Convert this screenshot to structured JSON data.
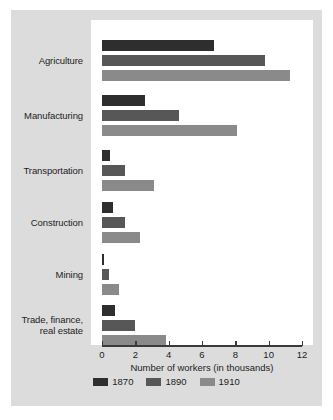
{
  "chart_data": {
    "type": "bar",
    "orientation": "horizontal",
    "title": "",
    "xlabel": "Number of workers (in thousands)",
    "ylabel": "",
    "xlim": [
      0,
      12
    ],
    "xticks": [
      0,
      2,
      4,
      6,
      8,
      10,
      12
    ],
    "xtick_labels": [
      "0",
      "2",
      "4",
      "6",
      "8",
      "10",
      "12"
    ],
    "grid": false,
    "legend_position": "bottom",
    "categories": [
      "Agriculture",
      "Manufacturing",
      "Transportation",
      "Construction",
      "Mining",
      "Trade, finance,\nreal estate"
    ],
    "category_lines": [
      [
        "Agriculture"
      ],
      [
        "Manufacturing"
      ],
      [
        "Transportation"
      ],
      [
        "Construction"
      ],
      [
        "Mining"
      ],
      [
        "Trade, finance,",
        "real estate"
      ]
    ],
    "series": [
      {
        "name": "1870",
        "color": "#2e2e2e",
        "values": [
          6.7,
          2.6,
          0.5,
          0.65,
          0.1,
          0.8
        ]
      },
      {
        "name": "1890",
        "color": "#575757",
        "values": [
          9.8,
          4.6,
          1.4,
          1.35,
          0.4,
          2.0
        ]
      },
      {
        "name": "1910",
        "color": "#8a8a8a",
        "values": [
          11.3,
          8.1,
          3.1,
          2.25,
          1.0,
          3.85
        ]
      }
    ]
  },
  "figure": {
    "background": "#dcdcdc",
    "plot_background": "#ffffff",
    "axis_color": "#3a3a3a",
    "text_color": "#1d1d1d"
  },
  "legend": {
    "items": [
      {
        "label": "1870",
        "color": "#2e2e2e"
      },
      {
        "label": "1890",
        "color": "#575757"
      },
      {
        "label": "1910",
        "color": "#8a8a8a"
      }
    ]
  },
  "axis": {
    "title": "Number of workers (in thousands)"
  }
}
